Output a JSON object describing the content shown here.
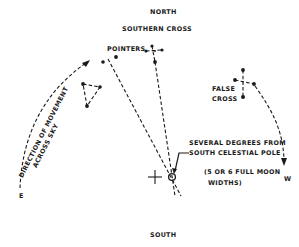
{
  "diagram": {
    "compass": {
      "north": "NORTH",
      "south": "SOUTH",
      "east": "E",
      "west": "W"
    },
    "labels": {
      "southern_cross": "SOUTHERN CROSS",
      "pointers": "POINTERS",
      "false_cross_line1": "FALSE",
      "false_cross_line2": "CROSS",
      "direction_line1": "DIRECTION OF MOVEMENT",
      "direction_line2": "ACROSS SKY",
      "pole_note_line1": "SEVERAL DEGREES FROM",
      "pole_note_line2": "SOUTH CELESTIAL POLE",
      "pole_note_line3": "(5 OR 6 FULL MOON",
      "pole_note_line4": "WIDTHS)"
    },
    "colors": {
      "ink": "#1a1a1a",
      "background": "#ffffff"
    }
  }
}
